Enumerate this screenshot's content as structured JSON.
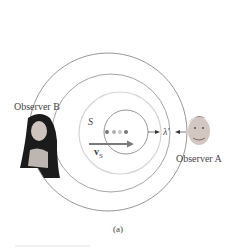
{
  "figure": {
    "caption": "(a)",
    "observer_b_label": "Observer B",
    "observer_a_label": "Observer A",
    "source_label": "S",
    "velocity_label": "v",
    "velocity_subscript": "S",
    "wavelength_label": "λ′"
  },
  "colors": {
    "outer_circle": "#8a8a8a",
    "light_circle": "#d0d0d0",
    "arrow": "#7a7a7a",
    "dot_dark": "#777777",
    "dot_light": "#b5b5b5"
  }
}
